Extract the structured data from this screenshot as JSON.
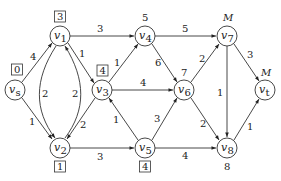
{
  "diagram": {
    "type": "directed-weighted-graph",
    "nodes": [
      {
        "id": "vs",
        "name": "v",
        "sub": "s",
        "x": 15,
        "y": 90,
        "label": "0",
        "label_boxed": true
      },
      {
        "id": "v1",
        "name": "v",
        "sub": "1",
        "x": 60,
        "y": 36,
        "label": "3",
        "label_boxed": true
      },
      {
        "id": "v2",
        "name": "v",
        "sub": "2",
        "x": 60,
        "y": 148,
        "label": "1",
        "label_boxed": true
      },
      {
        "id": "v3",
        "name": "v",
        "sub": "3",
        "x": 102,
        "y": 90,
        "label": "4",
        "label_boxed": true
      },
      {
        "id": "v4",
        "name": "v",
        "sub": "4",
        "x": 145,
        "y": 36,
        "label": "5",
        "label_boxed": false
      },
      {
        "id": "v5",
        "name": "v",
        "sub": "5",
        "x": 145,
        "y": 148,
        "label": "4",
        "label_boxed": true
      },
      {
        "id": "v6",
        "name": "v",
        "sub": "6",
        "x": 184,
        "y": 90,
        "label": "7",
        "label_boxed": false
      },
      {
        "id": "v7",
        "name": "v",
        "sub": "7",
        "x": 227,
        "y": 36,
        "label": "M",
        "label_boxed": false
      },
      {
        "id": "v8",
        "name": "v",
        "sub": "8",
        "x": 227,
        "y": 148,
        "label": "8",
        "label_boxed": false
      },
      {
        "id": "vt",
        "name": "v",
        "sub": "t",
        "x": 265,
        "y": 90,
        "label": "M",
        "label_boxed": false
      }
    ],
    "edges": [
      {
        "from": "vs",
        "to": "v1",
        "weight": "4"
      },
      {
        "from": "vs",
        "to": "v2",
        "weight": "1"
      },
      {
        "from": "v1",
        "to": "v2",
        "weight": "2",
        "curved": "left"
      },
      {
        "from": "v2",
        "to": "v1",
        "weight": "2",
        "curved": "right"
      },
      {
        "from": "v1",
        "to": "v3",
        "weight": "1"
      },
      {
        "from": "v3",
        "to": "v2",
        "weight": "2"
      },
      {
        "from": "v1",
        "to": "v4",
        "weight": "3"
      },
      {
        "from": "v3",
        "to": "v4",
        "weight": "1"
      },
      {
        "from": "v3",
        "to": "v6",
        "weight": "4"
      },
      {
        "from": "v2",
        "to": "v5",
        "weight": "3"
      },
      {
        "from": "v5",
        "to": "v3",
        "weight": "1"
      },
      {
        "from": "v4",
        "to": "v6",
        "weight": "6"
      },
      {
        "from": "v4",
        "to": "v7",
        "weight": "5"
      },
      {
        "from": "v5",
        "to": "v6",
        "weight": "3"
      },
      {
        "from": "v5",
        "to": "v8",
        "weight": "4"
      },
      {
        "from": "v6",
        "to": "v7",
        "weight": "2"
      },
      {
        "from": "v6",
        "to": "v8",
        "weight": "2"
      },
      {
        "from": "v7",
        "to": "v8",
        "weight": "1"
      },
      {
        "from": "v7",
        "to": "vt",
        "weight": "3"
      },
      {
        "from": "v8",
        "to": "vt",
        "weight": "1"
      }
    ]
  }
}
